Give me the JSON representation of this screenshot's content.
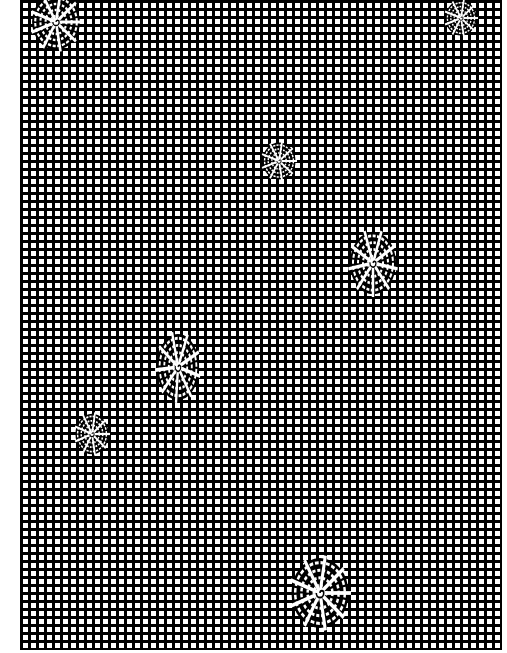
{
  "image": {
    "description": "Black grid of small white squares with scattered white radial spider-web motifs",
    "colors": {
      "background": "#ffffff",
      "grid_lines": "#000000",
      "cells": "#ffffff",
      "motif": "#ffffff"
    },
    "grid": {
      "left": 20,
      "top": 0,
      "width": 482,
      "height": 650,
      "pitch_px": 8,
      "line_px": 3
    },
    "motifs": [
      {
        "name": "web-top-left",
        "cx": 56,
        "cy": 22,
        "rx": 26,
        "ry": 30,
        "rotate": 0
      },
      {
        "name": "web-top-right",
        "cx": 461,
        "cy": 18,
        "rx": 17,
        "ry": 19,
        "rotate": 0
      },
      {
        "name": "web-upper-center",
        "cx": 279,
        "cy": 161,
        "rx": 18,
        "ry": 20,
        "rotate": 0
      },
      {
        "name": "web-right-middle",
        "cx": 373,
        "cy": 263,
        "rx": 25,
        "ry": 34,
        "rotate": 10
      },
      {
        "name": "web-left-middle",
        "cx": 178,
        "cy": 367,
        "rx": 23,
        "ry": 36,
        "rotate": 15
      },
      {
        "name": "web-lower-left",
        "cx": 92,
        "cy": 434,
        "rx": 18,
        "ry": 22,
        "rotate": 0
      },
      {
        "name": "web-bottom",
        "cx": 320,
        "cy": 593,
        "rx": 31,
        "ry": 38,
        "rotate": 0
      }
    ]
  }
}
